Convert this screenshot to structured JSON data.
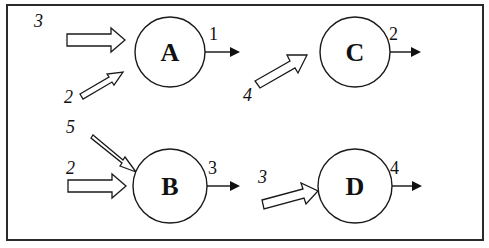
{
  "diagram": {
    "type": "flow-network",
    "frame": {
      "border_color": "#2a2a2a",
      "background": "#ffffff"
    },
    "nodes": [
      {
        "id": "A",
        "label": "A",
        "cx": 170,
        "cy": 52,
        "r": 35
      },
      {
        "id": "C",
        "label": "C",
        "cx": 355,
        "cy": 52,
        "r": 35
      },
      {
        "id": "B",
        "label": "B",
        "cx": 170,
        "cy": 186,
        "r": 37
      },
      {
        "id": "D",
        "label": "D",
        "cx": 355,
        "cy": 186,
        "r": 37
      }
    ],
    "inputs": [
      {
        "node": "A",
        "value": "3",
        "style": "wide-horizontal"
      },
      {
        "node": "A",
        "value": "2",
        "style": "thin-diagonal-up"
      },
      {
        "node": "C",
        "value": "4",
        "style": "wide-diagonal-up"
      },
      {
        "node": "B",
        "value": "5",
        "style": "thin-diagonal-down"
      },
      {
        "node": "B",
        "value": "2",
        "style": "wide-horizontal"
      },
      {
        "node": "D",
        "value": "3",
        "style": "wide-diagonal-up"
      }
    ],
    "outputs": [
      {
        "node": "A",
        "value": "1"
      },
      {
        "node": "C",
        "value": "2"
      },
      {
        "node": "B",
        "value": "3"
      },
      {
        "node": "D",
        "value": "4"
      }
    ]
  }
}
